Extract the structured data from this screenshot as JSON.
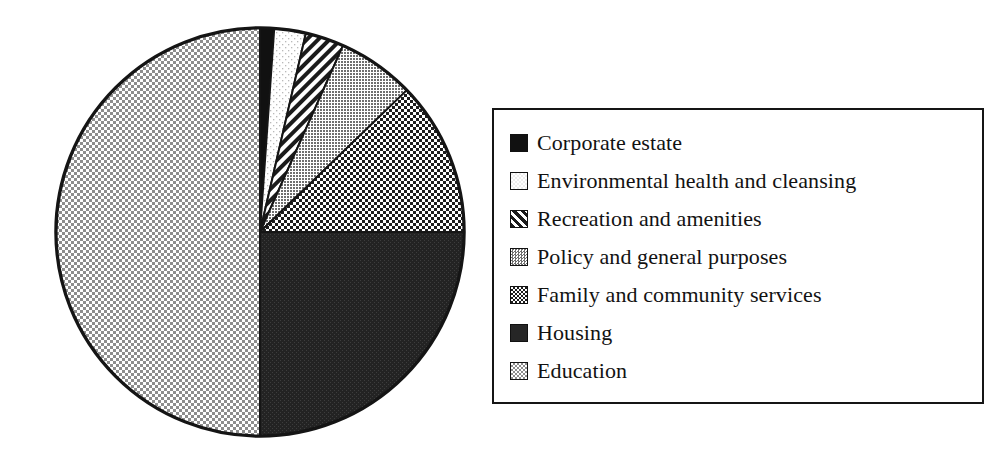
{
  "chart_data": {
    "type": "pie",
    "title": "",
    "subtitle": "",
    "xlabel": "",
    "ylabel": "",
    "grid": false,
    "legend_position": "right",
    "start_angle_deg": 0,
    "direction": "clockwise",
    "categories": [
      "Corporate estate",
      "Environmental health and cleansing",
      "Recreation and amenities",
      "Policy and general purposes",
      "Family and community services",
      "Housing",
      "Education"
    ],
    "values": [
      1.1,
      2.5,
      3.1,
      6.1,
      12.2,
      25.0,
      50.0
    ],
    "unit": "percent",
    "slices": [
      {
        "label": "Corporate estate",
        "value": 1.1,
        "start_deg": 0.0,
        "end_deg": 4.0,
        "fill": "solid-black",
        "color": "#111111"
      },
      {
        "label": "Environmental health and cleansing",
        "value": 2.5,
        "start_deg": 4.0,
        "end_deg": 13.0,
        "fill": "sparse-dots-white",
        "color": "#f4f4f4"
      },
      {
        "label": "Recreation and amenities",
        "value": 3.1,
        "start_deg": 13.0,
        "end_deg": 24.0,
        "fill": "diagonal-stripes",
        "color": "#8a8a8a"
      },
      {
        "label": "Policy and general purposes",
        "value": 6.1,
        "start_deg": 24.0,
        "end_deg": 46.0,
        "fill": "fine-gray-dots",
        "color": "#9a9a9a"
      },
      {
        "label": "Family and community services",
        "value": 12.2,
        "start_deg": 46.0,
        "end_deg": 90.0,
        "fill": "checkerboard-dark",
        "color": "#4a4a4a"
      },
      {
        "label": "Housing",
        "value": 25.0,
        "start_deg": 90.0,
        "end_deg": 180.0,
        "fill": "dense-dark",
        "color": "#2a2a2a"
      },
      {
        "label": "Education",
        "value": 50.0,
        "start_deg": 180.0,
        "end_deg": 360.0,
        "fill": "checkerboard-light",
        "color": "#d8d8d8"
      }
    ]
  },
  "legend": {
    "items": [
      {
        "label": "Corporate estate",
        "swatch": "solid-black"
      },
      {
        "label": "Environmental health and cleansing",
        "swatch": "sparse-dots-white"
      },
      {
        "label": "Recreation and amenities",
        "swatch": "diagonal-stripes"
      },
      {
        "label": "Policy and general purposes",
        "swatch": "fine-gray-dots"
      },
      {
        "label": "Family and community services",
        "swatch": "checkerboard-dark"
      },
      {
        "label": "Housing",
        "swatch": "dense-dark"
      },
      {
        "label": "Education",
        "swatch": "checkerboard-light"
      }
    ]
  },
  "colors": {
    "outline": "#151515",
    "background": "#ffffff",
    "text": "#121212"
  }
}
